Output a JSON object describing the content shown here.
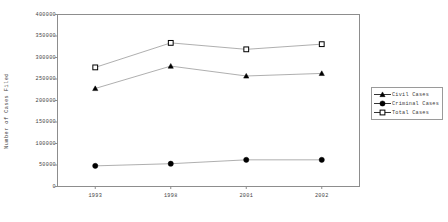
{
  "chart_data": {
    "type": "line",
    "title": "",
    "xlabel": "",
    "ylabel": "Number of Cases Filed",
    "categories": [
      "1993",
      "1998",
      "2001",
      "2002"
    ],
    "ylim": [
      0,
      400000
    ],
    "yticks": [
      "0",
      "50000",
      "100000",
      "150000",
      "200000",
      "250000",
      "300000",
      "350000",
      "400000"
    ],
    "ytick_values": [
      0,
      50000,
      100000,
      150000,
      200000,
      250000,
      300000,
      350000,
      400000
    ],
    "grid": false,
    "legend_position": "right",
    "series": [
      {
        "name": "Civil Cases",
        "marker": "filled-triangle",
        "color": "#000000",
        "values": [
          228000,
          280000,
          257000,
          263000
        ]
      },
      {
        "name": "Criminal Cases",
        "marker": "filled-circle",
        "color": "#000000",
        "values": [
          48000,
          53000,
          62000,
          62000
        ]
      },
      {
        "name": "Total Cases",
        "marker": "open-square",
        "color": "#000000",
        "values": [
          277000,
          334000,
          319000,
          331000
        ]
      }
    ]
  },
  "legend": {
    "items": [
      {
        "label": "Civil Cases"
      },
      {
        "label": "Criminal Cases"
      },
      {
        "label": "Total Cases"
      }
    ]
  },
  "axis": {
    "y_title": "Number of Cases Filed"
  }
}
